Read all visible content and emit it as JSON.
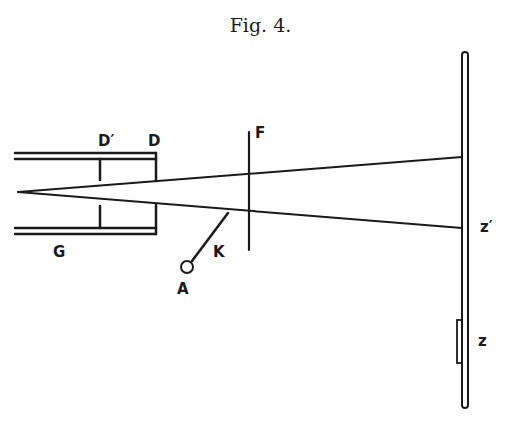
{
  "figure": {
    "title": "Fig. 4."
  },
  "labels": {
    "d_prime": "D′",
    "d": "D",
    "f": "F",
    "g": "G",
    "k": "K",
    "a": "A",
    "z_prime": "z′",
    "z": "z"
  },
  "colors": {
    "ink": "#1a1a1a",
    "background": "#ffffff"
  }
}
